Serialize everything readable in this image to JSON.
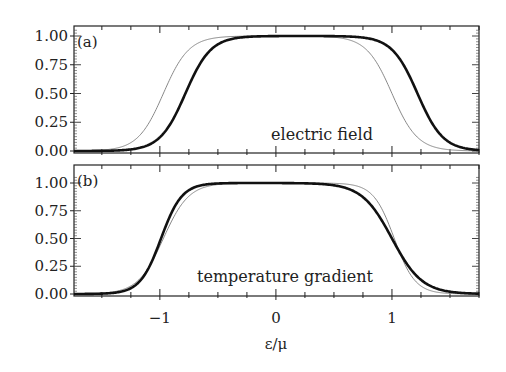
{
  "chart_data": {
    "type": "line",
    "xlabel": "ε/μ",
    "xlim": [
      -1.74,
      1.75
    ],
    "x_ticks": [
      -1,
      0,
      1
    ],
    "x_tick_labels": [
      "−1",
      "0",
      "1"
    ],
    "x_minor_step": 0.25,
    "y_ticks": [
      0.0,
      0.25,
      0.5,
      0.75,
      1.0
    ],
    "y_tick_labels": [
      "0.00",
      "0.25",
      "0.50",
      "0.75",
      "1.00"
    ],
    "panels": [
      {
        "label": "(a)",
        "annotation": "electric field",
        "ylim": [
          0,
          1.05
        ],
        "series": [
          {
            "name": "thin",
            "style": "thin",
            "color": "#888888",
            "left_mid": -0.97,
            "left_width": 0.11,
            "right_mid": 1.0,
            "right_width": 0.11
          },
          {
            "name": "thick",
            "style": "thick",
            "color": "#111111",
            "left_mid": -0.78,
            "left_width": 0.11,
            "right_mid": 1.22,
            "right_width": 0.11
          }
        ]
      },
      {
        "label": "(b)",
        "annotation": "temperature gradient",
        "ylim": [
          0,
          1.05
        ],
        "series": [
          {
            "name": "thin",
            "style": "thin",
            "color": "#888888",
            "left_mid": -0.97,
            "left_width": 0.11,
            "right_mid": 1.02,
            "right_width": 0.09
          },
          {
            "name": "thick",
            "style": "thick",
            "color": "#111111",
            "left_mid": -0.99,
            "left_width": 0.09,
            "right_mid": 1.0,
            "right_width": 0.13
          }
        ]
      }
    ]
  }
}
